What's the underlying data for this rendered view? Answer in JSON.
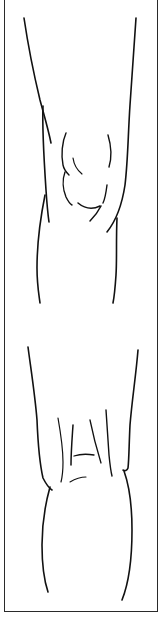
{
  "illustration": {
    "subject": "knee line drawing",
    "views": [
      {
        "id": "front-view",
        "label": ""
      },
      {
        "id": "back-view",
        "label": ""
      }
    ],
    "colors": {
      "background": "#ffffff",
      "line": "#111111",
      "frame": "#2a2a2a"
    }
  }
}
